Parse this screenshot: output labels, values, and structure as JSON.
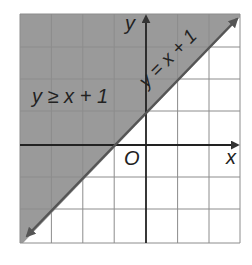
{
  "graph": {
    "inequality_label": "y ≥ x + 1",
    "boundary_label": "y = x + 1",
    "x_axis_label": "x",
    "y_axis_label": "y",
    "origin_label": "O",
    "x_range": [
      -4,
      3
    ],
    "y_range": [
      -3,
      4
    ],
    "shade_color": "#9a9a9a",
    "grid_color": "#8c8c8c",
    "line_color": "#555555"
  }
}
